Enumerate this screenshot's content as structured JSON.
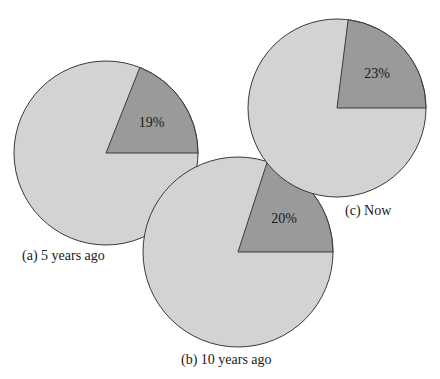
{
  "chart_data": [
    {
      "type": "pie",
      "title": "(a) 5 years ago",
      "categories": [
        "Highlighted",
        "Other"
      ],
      "values": [
        19,
        81
      ],
      "slice_label": "19%",
      "geometry": {
        "cx": 106,
        "cy": 153,
        "r": 92
      }
    },
    {
      "type": "pie",
      "title": "(b) 10 years ago",
      "categories": [
        "Highlighted",
        "Other"
      ],
      "values": [
        20,
        80
      ],
      "slice_label": "20%",
      "geometry": {
        "cx": 238,
        "cy": 252,
        "r": 95
      }
    },
    {
      "type": "pie",
      "title": "(c) Now",
      "categories": [
        "Highlighted",
        "Other"
      ],
      "values": [
        23,
        77
      ],
      "slice_label": "23%",
      "geometry": {
        "cx": 337,
        "cy": 108,
        "r": 89
      }
    }
  ],
  "colors": {
    "highlight": "#9a9a9a",
    "other": "#d3d3d3",
    "stroke": "#3a3a3a"
  },
  "captions": {
    "a": "(a) 5 years ago",
    "b": "(b) 10 years ago",
    "c": "(c) Now"
  }
}
